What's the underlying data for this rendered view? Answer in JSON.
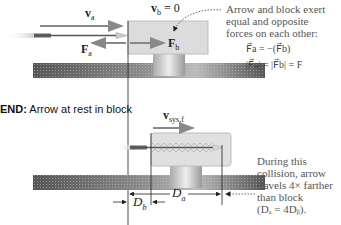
{
  "figure": {
    "top_panel": {
      "velocity_arrow_label": "v",
      "velocity_arrow_sub": "a",
      "block_velocity_label": "v",
      "block_velocity_sub": "b",
      "block_velocity_value": "= 0",
      "force_on_arrow_label": "F",
      "force_on_arrow_sub": "a",
      "force_on_block_label": "F",
      "force_on_block_sub": "b"
    },
    "annotation_top": {
      "lines": [
        "Arrow and block exert",
        "equal and opposite",
        "forces on each other:"
      ],
      "equation1": "F⃗a = −(F⃗b)",
      "equation2": "|F⃗a| = |F⃗b| = F"
    },
    "end_heading": {
      "prefix": "END:",
      "text": " Arrow at rest in block"
    },
    "bottom_panel": {
      "system_velocity_label": "v",
      "system_velocity_sub": "sys,f",
      "distance_block_label": "D",
      "distance_block_sub": "b",
      "distance_arrow_label": "D",
      "distance_arrow_sub": "a"
    },
    "annotation_bottom": {
      "lines": [
        "During this",
        "collision, arrow",
        "travels 4× farther",
        "than block",
        "(Dₐ = 4Dᵦ)."
      ]
    },
    "colors": {
      "arrow_vector": "#8a8a8a",
      "block_fill": "#dcdcdc",
      "block_stroke": "#b8b8b8",
      "rail_dark": "#5a5a5a",
      "rail_light": "#bdbdbd",
      "guide_line": "#222222",
      "note_text": "#555555"
    }
  }
}
